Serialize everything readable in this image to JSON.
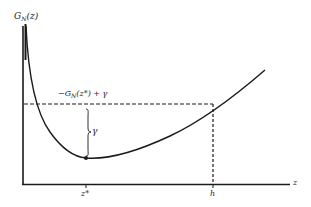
{
  "diagram": {
    "y_axis_label": {
      "main": "G",
      "sub": "N",
      "arg": "(z)"
    },
    "x_axis_label": "z",
    "level_label": {
      "prefix": "−G",
      "sub": "N",
      "rest": "(z*) + γ"
    },
    "gap_label": "γ",
    "tick_labels": {
      "z_star": "z*",
      "h": "h"
    },
    "colors": {
      "line": "#1a1a1a",
      "background": "#ffffff"
    }
  }
}
